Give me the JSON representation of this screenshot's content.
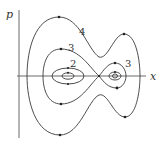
{
  "diagram": {
    "type": "phase-portrait",
    "axes": {
      "vertical_label": "p",
      "horizontal_label": "x"
    },
    "curve_labels": [
      {
        "id": "curve-4-outer",
        "label": "4"
      },
      {
        "id": "curve-3-left",
        "label": "3"
      },
      {
        "id": "curve-2-left",
        "label": "2"
      },
      {
        "id": "curve-3-right",
        "label": "3"
      }
    ],
    "colors": {
      "line": "#3a3a3a",
      "axis": "#6a6a6a",
      "background": "#ffffff"
    }
  }
}
